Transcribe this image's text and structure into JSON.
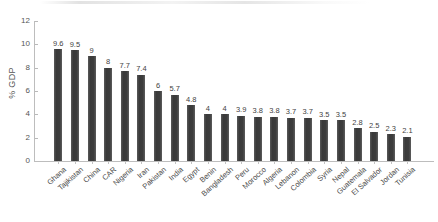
{
  "chart_data": {
    "type": "bar",
    "title": "",
    "subtitle": "",
    "xlabel": "",
    "ylabel": "% GDP",
    "ylim": [
      0,
      12
    ],
    "ytick_values": [
      0,
      2,
      4,
      6,
      8,
      10,
      12
    ],
    "ytick_labels": [
      "0",
      "2",
      "4",
      "6",
      "8",
      "10",
      "12"
    ],
    "grid": false,
    "legend": false,
    "legend_position": "none",
    "bar_color": "#434343",
    "axis_color": "#bdbdbd",
    "text_color": "#4a4a4a",
    "show_value_labels": true,
    "categories": [
      "Ghana",
      "Tajikistan",
      "China",
      "CAR",
      "Nigeria",
      "Iran",
      "Pakistan",
      "India",
      "Egypt",
      "Benin",
      "Bangladesh",
      "Peru",
      "Morocco",
      "Algeria",
      "Lebanon",
      "Colombia",
      "Syria",
      "Nepal",
      "Guatemala",
      "El Salvador",
      "Jordan",
      "Tunisia"
    ],
    "values": [
      9.6,
      9.5,
      9,
      8,
      7.7,
      7.4,
      6,
      5.7,
      4.8,
      4,
      4,
      3.9,
      3.8,
      3.8,
      3.7,
      3.7,
      3.5,
      3.5,
      2.8,
      2.5,
      2.3,
      2.1
    ],
    "value_labels": [
      "9.6",
      "9.5",
      "9",
      "8",
      "7.7",
      "7.4",
      "6",
      "5.7",
      "4.8",
      "4",
      "4",
      "3.9",
      "3.8",
      "3.8",
      "3.7",
      "3.7",
      "3.5",
      "3.5",
      "2.8",
      "2.5",
      "2.3",
      "2.1"
    ]
  }
}
